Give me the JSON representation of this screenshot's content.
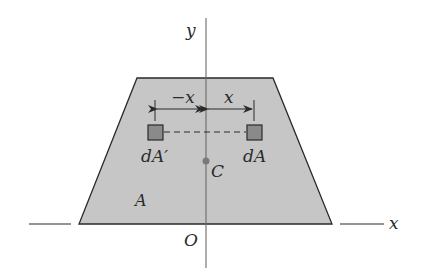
{
  "diagram": {
    "type": "centroid-symmetry-figure",
    "colors": {
      "background": "#ffffff",
      "area_fill": "#c6c6c6",
      "element_fill": "#8a8a8a",
      "stroke": "#2a2a2a",
      "axis": "#6a6a6a",
      "centroid": "#7a7a7a"
    },
    "labels": {
      "y_axis": "y",
      "x_axis": "x",
      "origin": "O",
      "centroid": "C",
      "area": "A",
      "element_right": "dA",
      "element_left": "dA′",
      "dim_left": "−x",
      "dim_right": "x"
    }
  }
}
